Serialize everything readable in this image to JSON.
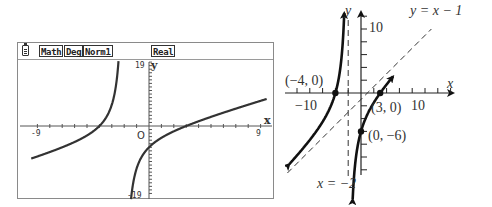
{
  "calculator": {
    "status_bar": {
      "battery_icon": "battery-icon",
      "mode_tags": [
        "Math",
        "Deg",
        "Norm1"
      ],
      "real_tag": "Real"
    },
    "graph": {
      "x_label": "x",
      "y_label": "y",
      "origin_label": "O",
      "xmin_label": "-9",
      "xmax_label": "9",
      "ymax_label": "19",
      "ymin_label": "-19"
    }
  },
  "textbook": {
    "x_label": "x",
    "y_label": "y",
    "x_neg_label": "−10",
    "x_pos_label": "10",
    "y_pos_label": "10",
    "oblique_asymptote_label": "y = x − 1",
    "vertical_asymptote_label": "x = −2",
    "points": [
      {
        "label": "(−4, 0)",
        "x": -4,
        "y": 0
      },
      {
        "label": "(3, 0)",
        "x": 3,
        "y": 0
      },
      {
        "label": "(0, −6)",
        "x": 0,
        "y": -6
      }
    ]
  },
  "chart_data": [
    {
      "type": "line",
      "title": "Calculator graph of f(x) = (x² + x − 12)/(x + 2)",
      "xlabel": "x",
      "ylabel": "y",
      "xlim": [
        -9.4,
        9.4
      ],
      "ylim": [
        -19,
        19
      ],
      "x_ticks": [
        -9,
        9
      ],
      "y_ticks": [
        -19,
        19
      ],
      "grid": false,
      "series": [
        {
          "name": "f(x)",
          "function": "(x^2 + x - 12)/(x + 2)",
          "vertical_asymptote": -2,
          "x": [
            -9.4,
            -8,
            -6,
            -5,
            -4,
            -3,
            -2.5,
            -2.2
          ],
          "y": [
            -12.3,
            -9.3,
            -6.5,
            -5.3,
            0,
            6,
            13.5,
            31
          ]
        },
        {
          "name": "f(x) right branch",
          "x": [
            -1.8,
            -1.5,
            -1,
            0,
            1,
            3,
            5,
            7,
            9.4
          ],
          "y": [
            -41,
            -19.5,
            -12,
            -6,
            -3.3,
            0,
            2.6,
            4.9,
            7.4
          ]
        }
      ]
    },
    {
      "type": "line",
      "title": "Sketch of f(x) with asymptotes",
      "xlabel": "x",
      "ylabel": "y",
      "xlim": [
        -11,
        16
      ],
      "ylim": [
        -13,
        14
      ],
      "x_ticks": [
        -10,
        10
      ],
      "y_ticks": [
        10
      ],
      "grid": false,
      "annotations": [
        "(−4, 0)",
        "(3, 0)",
        "(0, −6)",
        "y = x − 1",
        "x = −2"
      ],
      "series": [
        {
          "name": "f(x) left branch",
          "x": [
            -9.5,
            -7,
            -5,
            -4,
            -3,
            -2.5,
            -2.25
          ],
          "y": [
            -11.8,
            -8.8,
            -5.3,
            0,
            6,
            13.5,
            21
          ]
        },
        {
          "name": "f(x) right branch",
          "x": [
            -1.75,
            -1.5,
            -1,
            0,
            1,
            3,
            5
          ],
          "y": [
            -21,
            -19.5,
            -12,
            -6,
            -3.3,
            0,
            2.6
          ]
        },
        {
          "name": "Oblique asymptote y = x − 1",
          "style": "dashed",
          "x": [
            -11,
            12
          ],
          "y": [
            -12,
            11
          ]
        },
        {
          "name": "Vertical asymptote x = −2",
          "style": "dashed",
          "x": [
            -2,
            -2
          ],
          "y": [
            -13,
            14
          ]
        }
      ],
      "points": [
        [
          -4,
          0
        ],
        [
          3,
          0
        ],
        [
          0,
          -6
        ]
      ]
    }
  ]
}
